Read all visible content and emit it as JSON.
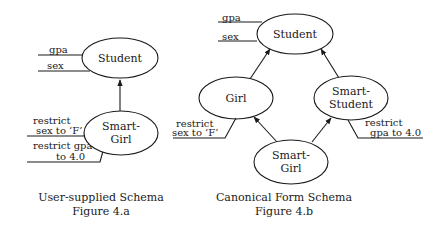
{
  "figure_a": {
    "nodes": {
      "student": {
        "label": "Student"
      },
      "smart_girl": {
        "line1": "Smart-",
        "line2": "Girl"
      }
    },
    "attributes": {
      "gpa": "gpa",
      "sex": "sex"
    },
    "restrictions": {
      "sex": {
        "line1": "restrict",
        "line2": "sex to ‘F’"
      },
      "gpa": {
        "line1": "restrict gpa",
        "line2": "to 4.0"
      }
    },
    "caption": {
      "title": "User-supplied Schema",
      "figure": "Figure 4.a"
    }
  },
  "figure_b": {
    "nodes": {
      "student": {
        "label": "Student"
      },
      "girl": {
        "label": "Girl"
      },
      "smart_student": {
        "line1": "Smart-",
        "line2": "Student"
      },
      "smart_girl": {
        "line1": "Smart-",
        "line2": "Girl"
      }
    },
    "attributes": {
      "gpa": "gpa",
      "sex": "sex"
    },
    "restrictions": {
      "sex": {
        "line1": "restrict",
        "line2": "sex to ‘F’"
      },
      "gpa": {
        "line1": "restrict",
        "line2": "gpa to 4.0"
      }
    },
    "caption": {
      "title": "Canonical Form Schema",
      "figure": "Figure 4.b"
    }
  }
}
